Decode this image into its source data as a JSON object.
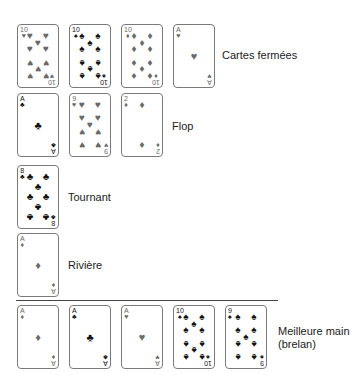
{
  "colors": {
    "red_suit": "#6a6a6a",
    "black_suit": "#111111",
    "card_border": "#7a7a7a",
    "separator": "#444444"
  },
  "rows": [
    {
      "name": "hole-cards",
      "label": "Cartes fermées",
      "cards": [
        {
          "rank": "10",
          "suit": "hearts",
          "symbol": "♥"
        },
        {
          "rank": "10",
          "suit": "spades",
          "symbol": "♠"
        },
        {
          "rank": "10",
          "suit": "diamonds",
          "symbol": "♦"
        },
        {
          "rank": "A",
          "suit": "hearts",
          "symbol": "♥"
        }
      ]
    },
    {
      "name": "flop",
      "label": "Flop",
      "cards": [
        {
          "rank": "A",
          "suit": "clubs",
          "symbol": "♣"
        },
        {
          "rank": "9",
          "suit": "hearts",
          "symbol": "♥"
        },
        {
          "rank": "2",
          "suit": "diamonds",
          "symbol": "♦"
        }
      ]
    },
    {
      "name": "turn",
      "label": "Tournant",
      "cards": [
        {
          "rank": "8",
          "suit": "clubs",
          "symbol": "♣"
        }
      ]
    },
    {
      "name": "river",
      "label": "Rivière",
      "cards": [
        {
          "rank": "A",
          "suit": "diamonds",
          "symbol": "♦"
        }
      ]
    },
    {
      "name": "best-hand",
      "label_line1": "Meilleure main",
      "label_line2": "(brelan)",
      "cards": [
        {
          "rank": "A",
          "suit": "diamonds",
          "symbol": "♦"
        },
        {
          "rank": "A",
          "suit": "clubs",
          "symbol": "♣"
        },
        {
          "rank": "A",
          "suit": "hearts",
          "symbol": "♥"
        },
        {
          "rank": "10",
          "suit": "spades",
          "symbol": "♠"
        },
        {
          "rank": "9",
          "suit": "spades",
          "symbol": "♠"
        }
      ]
    }
  ]
}
